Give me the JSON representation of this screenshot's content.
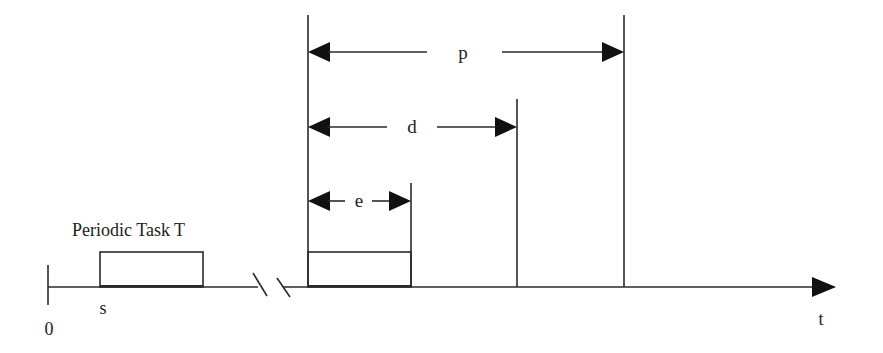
{
  "diagram": {
    "type": "timing-diagram",
    "title": "Periodic Task T",
    "labels": {
      "origin": "0",
      "start": "s",
      "time_axis": "t",
      "period": "p",
      "deadline": "d",
      "execution": "e"
    },
    "elements": {
      "task_instance_1": "execution block starting at s",
      "axis_break": "//",
      "task_instance_2": "execution block of length e at start of period"
    },
    "colors": {
      "line": "#2a2a2a",
      "arrowhead": "#111111",
      "text": "#222222",
      "background": "#ffffff"
    }
  }
}
